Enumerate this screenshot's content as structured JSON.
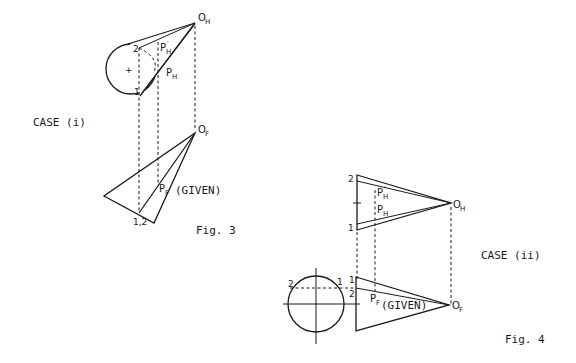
{
  "figure3": {
    "case_label": "CASE (i)",
    "caption": "Fig. 3",
    "labels": {
      "oh": "O",
      "oh_sub": "H",
      "of": "O",
      "of_sub": "F",
      "ph": "P",
      "ph_sub": "H",
      "ph_prime": "P",
      "ph_prime_sub": "H",
      "ph_prime_mark": "′",
      "pf": "P",
      "pf_sub": "F",
      "given": "(GIVEN)",
      "pt1": "1",
      "pt2": "2",
      "pt12": "1,2"
    }
  },
  "figure4": {
    "case_label": "CASE (ii)",
    "caption": "Fig. 4",
    "labels": {
      "oh": "O",
      "oh_sub": "H",
      "of": "O",
      "of_sub": "F",
      "ph": "P",
      "ph_sub": "H",
      "ph_prime": "P",
      "ph_prime_sub": "H",
      "ph_prime_mark": "′",
      "pf": "P",
      "pf_sub": "F",
      "given": "(GIVEN)",
      "top_pt1": "1",
      "top_pt2": "2",
      "front_pt1": "1",
      "front_pt2": "2",
      "circle_pt1": "1",
      "circle_pt2": "2"
    }
  }
}
